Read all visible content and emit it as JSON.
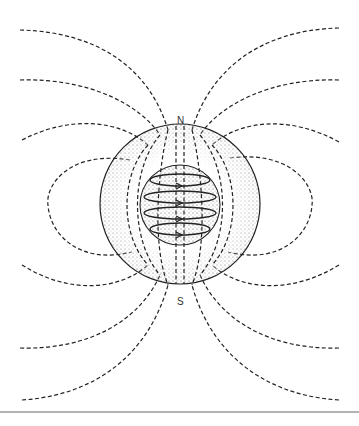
{
  "diagram": {
    "type": "magnetic-dipole-field",
    "labels": {
      "north": "N",
      "south": "S"
    },
    "elements": [
      "outer-sphere-shell",
      "inner-core",
      "current-loops",
      "field-lines"
    ],
    "colors": {
      "ink": "#222222",
      "background": "#ffffff",
      "stipple": "#555555"
    }
  }
}
